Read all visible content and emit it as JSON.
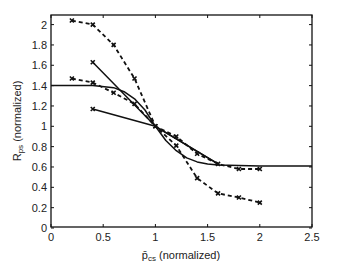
{
  "chart_data": {
    "type": "line",
    "title": "",
    "xlabel": "p̄cs (normalized)",
    "xlabel_main": "p̄",
    "xlabel_sub": "cs",
    "xlabel_rest": " (normalized)",
    "ylabel": "Rps (normalized)",
    "ylabel_main": "R",
    "ylabel_sub": "ps",
    "ylabel_rest": " (normalized)",
    "xlim": [
      0,
      2.5
    ],
    "ylim": [
      0,
      2.1
    ],
    "xticks": [
      0,
      0.5,
      1,
      1.5,
      2,
      2.5
    ],
    "xtick_labels": [
      "0",
      "0.5",
      "1",
      "1.5",
      "2",
      "2.5"
    ],
    "yticks": [
      0,
      0.2,
      0.4,
      0.6,
      0.8,
      1,
      1.2,
      1.4,
      1.6,
      1.8,
      2
    ],
    "ytick_labels": [
      "0",
      "0.2",
      "0.4",
      "0.6",
      "0.8",
      "1",
      "1.2",
      "1.4",
      "1.6",
      "1.8",
      "2"
    ],
    "grid": false,
    "legend": null,
    "series": [
      {
        "name": "dashed-upper",
        "style": "dashed",
        "marker": "x",
        "x": [
          0.2,
          0.4,
          0.6,
          0.8,
          1.0,
          1.2,
          1.4,
          1.6,
          1.8,
          2.0
        ],
        "y": [
          2.04,
          2.0,
          1.8,
          1.47,
          1.0,
          0.81,
          0.49,
          0.34,
          0.3,
          0.25
        ]
      },
      {
        "name": "dashed-lower",
        "style": "dashed",
        "marker": "x",
        "x": [
          0.2,
          0.4,
          0.6,
          0.8,
          1.0,
          1.2,
          1.4,
          1.6,
          1.8,
          2.0
        ],
        "y": [
          1.47,
          1.43,
          1.33,
          1.22,
          1.0,
          0.9,
          0.73,
          0.63,
          0.58,
          0.58
        ]
      },
      {
        "name": "solid-steep",
        "style": "solid",
        "marker": "x-start",
        "x": [
          0.4,
          1.0,
          1.6
        ],
        "y": [
          1.63,
          1.0,
          0.63
        ]
      },
      {
        "name": "solid-shallow",
        "style": "solid",
        "marker": "x-start",
        "x": [
          0.4,
          1.0,
          1.6
        ],
        "y": [
          1.17,
          1.0,
          0.63
        ]
      },
      {
        "name": "solid-smooth",
        "style": "solid",
        "marker": "none",
        "x": [
          0,
          0.2,
          0.4,
          0.6,
          0.7,
          0.8,
          0.9,
          1.0,
          1.1,
          1.2,
          1.3,
          1.4,
          1.5,
          1.6,
          1.8,
          2.0,
          2.5
        ],
        "y": [
          1.4,
          1.4,
          1.4,
          1.38,
          1.34,
          1.27,
          1.16,
          1.0,
          0.86,
          0.76,
          0.69,
          0.65,
          0.63,
          0.62,
          0.615,
          0.61,
          0.61
        ]
      }
    ]
  }
}
